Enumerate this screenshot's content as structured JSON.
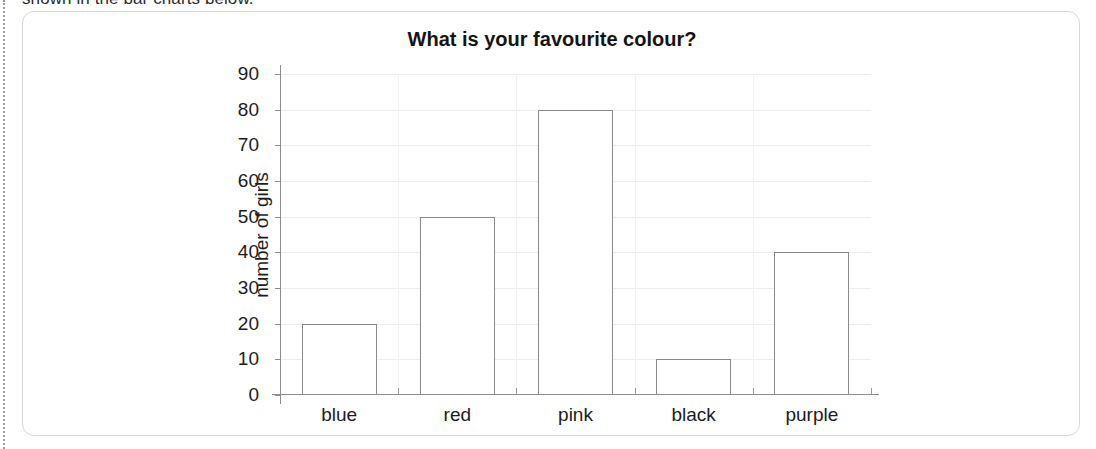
{
  "page": {
    "clipped_line_above_card": "shown in the bar charts below."
  },
  "chart_data": {
    "type": "bar",
    "title": "What is your favourite colour?",
    "xlabel": "",
    "ylabel": "number of girls",
    "categories": [
      "blue",
      "red",
      "pink",
      "black",
      "purple"
    ],
    "values": [
      20,
      50,
      80,
      10,
      40
    ],
    "ylim": [
      0,
      90
    ],
    "ytick_labels": [
      "0",
      "10",
      "20",
      "30",
      "40",
      "50",
      "60",
      "70",
      "80",
      "90"
    ],
    "ytick_values": [
      0,
      10,
      20,
      30,
      40,
      50,
      60,
      70,
      80,
      90
    ],
    "grid": "horizontal and faint vertical",
    "legend": "none",
    "bar_style": {
      "fill": "#ffffff",
      "edge": "#8a8a8a"
    }
  }
}
